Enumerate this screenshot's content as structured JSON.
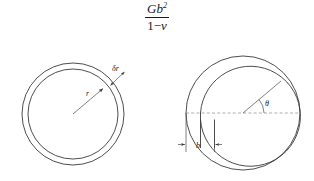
{
  "figure": {
    "title_formula": {
      "numerator_base": "Gb",
      "numerator_exponent": "2",
      "denominator_one": "1",
      "denominator_minus": "−",
      "denominator_nu": "v"
    },
    "left_panel": {
      "name": "expanded-loop-diagram",
      "labels": {
        "radius": "r",
        "radius_increment": "δr"
      },
      "geometry": {
        "center_x": 73,
        "center_y": 114,
        "outer_radius": 51,
        "inner_radius": 45,
        "radius_arrow_from": [
          73,
          114
        ],
        "radius_arrow_to": [
          104,
          88
        ]
      }
    },
    "right_panel": {
      "name": "dislocation-loop-diagram",
      "labels": {
        "angle": "θ",
        "burgers_vector": "b"
      },
      "geometry": {
        "outer_center_x": 243,
        "outer_center_y": 113,
        "outer_radius": 57,
        "inner_center_x": 250,
        "inner_center_y": 119,
        "inner_radius": 50,
        "cut_line_y": 113,
        "offset_b": 14
      }
    },
    "colors": {
      "line": "#3a3a3a",
      "dashed_line": "#8a8a8a",
      "text": "#1a1a1a",
      "background": "#ffffff"
    }
  }
}
